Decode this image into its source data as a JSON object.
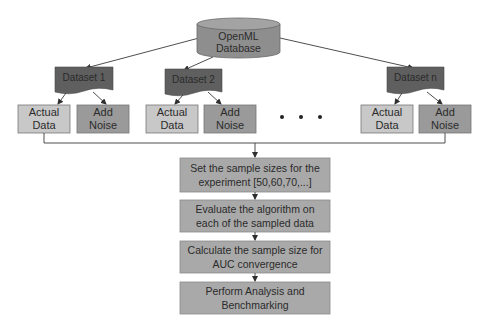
{
  "diagram": {
    "source": {
      "line1": "OpenML",
      "line2": "Database"
    },
    "datasets": [
      {
        "name": "Dataset 1",
        "actual": {
          "line1": "Actual",
          "line2": "Data"
        },
        "noise": {
          "line1": "Add",
          "line2": "Noise"
        }
      },
      {
        "name": "Dataset 2",
        "actual": {
          "line1": "Actual",
          "line2": "Data"
        },
        "noise": {
          "line1": "Add",
          "line2": "Noise"
        }
      },
      {
        "name": "Dataset n",
        "actual": {
          "line1": "Actual",
          "line2": "Data"
        },
        "noise": {
          "line1": "Add",
          "line2": "Noise"
        }
      }
    ],
    "ellipsis": "• • •",
    "steps": [
      {
        "line1": "Set the sample sizes for the",
        "line2": "experiment [50,60,70,...]"
      },
      {
        "line1": "Evaluate the algorithm on",
        "line2": "each of the sampled data"
      },
      {
        "line1": "Calculate the sample size for",
        "line2": "AUC convergence"
      },
      {
        "line1": "Perform Analysis and",
        "line2": "Benchmarking"
      }
    ],
    "colors": {
      "database": "#8e8e8e",
      "database_top": "#a3a3a3",
      "dataset": "#5f5f5f",
      "actual_data": "#c8c8c8",
      "add_noise": "#9a9a9a",
      "step": "#a9a9a9",
      "line": "#3a3a3a"
    }
  }
}
